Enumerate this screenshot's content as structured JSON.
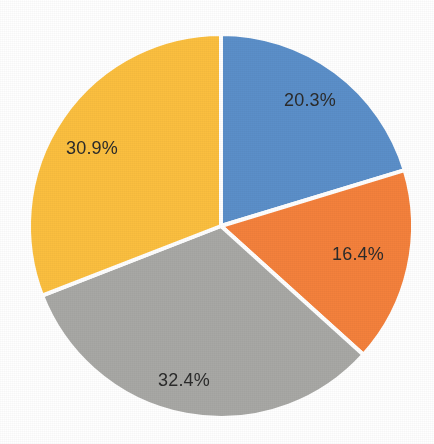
{
  "chart_data": {
    "type": "pie",
    "title": "",
    "subtitle": "",
    "xlabel": "",
    "ylabel": "",
    "legend": "none",
    "grid": false,
    "start_angle_deg": 0,
    "direction": "clockwise",
    "background_color": "#ffffff",
    "slice_separator_color": "#ffffff",
    "label_color": "#2b2b2b",
    "label_position": "inside",
    "categories": [
      "Slice 1",
      "Slice 2",
      "Slice 3",
      "Slice 4"
    ],
    "values": [
      20.3,
      16.4,
      32.4,
      30.9
    ],
    "labels": [
      "20.3%",
      "16.4%",
      "32.4%",
      "30.9%"
    ],
    "colors": [
      "#5B8FC9",
      "#F4813C",
      "#A8A8A5",
      "#FBBF3F"
    ],
    "total": 100.0,
    "slices": [
      {
        "index": 0,
        "name": "blue-slice",
        "value": 20.3,
        "label": "20.3%",
        "color": "#5B8FC9",
        "start_angle_deg": 0.0,
        "end_angle_deg": 73.08,
        "label_x": 310,
        "label_y": 101
      },
      {
        "index": 1,
        "name": "orange-slice",
        "value": 16.4,
        "label": "16.4%",
        "color": "#F4813C",
        "start_angle_deg": 73.08,
        "end_angle_deg": 132.12,
        "label_x": 358,
        "label_y": 255
      },
      {
        "index": 2,
        "name": "gray-slice",
        "value": 32.4,
        "label": "32.4%",
        "color": "#A8A8A5",
        "start_angle_deg": 132.12,
        "end_angle_deg": 248.76,
        "label_x": 184,
        "label_y": 381
      },
      {
        "index": 3,
        "name": "yellow-slice",
        "value": 30.9,
        "label": "30.9%",
        "color": "#FBBF3F",
        "start_angle_deg": 248.76,
        "end_angle_deg": 360.0,
        "label_x": 92,
        "label_y": 149
      }
    ],
    "geometry": {
      "center_x": 221,
      "center_y": 226,
      "radius": 192
    }
  }
}
